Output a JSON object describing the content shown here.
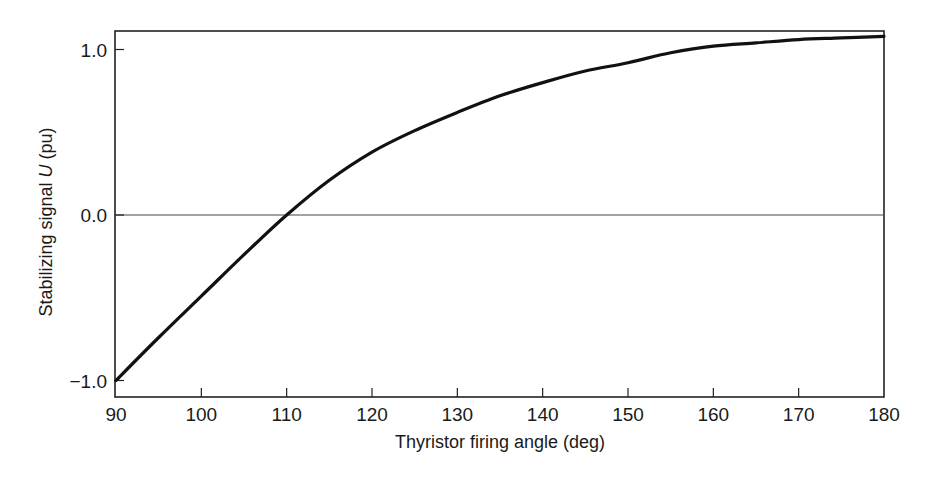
{
  "chart_data": {
    "type": "line",
    "title": "",
    "xlabel": "Thyristor firing angle (deg)",
    "ylabel_prefix": "Stabilizing signal ",
    "ylabel_var": "U",
    "ylabel_suffix": " (pu)",
    "ylabel": "Stabilizing signal U (pu)",
    "xlim": [
      90,
      180
    ],
    "ylim": [
      -1.1,
      1.1
    ],
    "grid": false,
    "legend": null,
    "reference_lines": [
      {
        "axis": "y",
        "value": 0.0
      }
    ],
    "x_ticks": [
      90,
      100,
      110,
      120,
      130,
      140,
      150,
      160,
      170,
      180
    ],
    "x_tick_labels": [
      "90",
      "100",
      "110",
      "120",
      "130",
      "140",
      "150",
      "160",
      "170",
      "180"
    ],
    "y_ticks": [
      -1.0,
      0.0,
      1.0
    ],
    "y_tick_labels": [
      "−1.0",
      "0.0",
      "1.0"
    ],
    "series": [
      {
        "name": "U",
        "color": "#111111",
        "x": [
          90,
          95,
          100,
          105,
          110,
          115,
          120,
          125,
          130,
          135,
          140,
          145,
          150,
          155,
          160,
          165,
          170,
          175,
          180
        ],
        "values": [
          -1.0,
          -0.74,
          -0.49,
          -0.24,
          0.0,
          0.21,
          0.38,
          0.51,
          0.62,
          0.72,
          0.8,
          0.87,
          0.92,
          0.98,
          1.02,
          1.04,
          1.06,
          1.07,
          1.08
        ]
      }
    ]
  }
}
